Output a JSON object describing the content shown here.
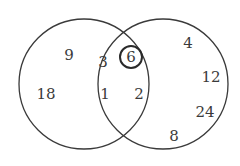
{
  "diagram": {
    "type": "venn",
    "circles": [
      {
        "id": "left",
        "cx": 84,
        "cy": 84,
        "r": 65
      },
      {
        "id": "right",
        "cx": 163,
        "cy": 84,
        "r": 65
      }
    ],
    "highlight": {
      "cx": 131,
      "cy": 56,
      "r": 11,
      "value": "6"
    },
    "numbers": {
      "left_only": [
        {
          "value": "9",
          "x": 69,
          "y": 59
        },
        {
          "value": "18",
          "x": 45,
          "y": 98
        }
      ],
      "intersection": [
        {
          "value": "3",
          "x": 103,
          "y": 65
        },
        {
          "value": "6",
          "x": 131,
          "y": 61
        },
        {
          "value": "1",
          "x": 105,
          "y": 97
        },
        {
          "value": "2",
          "x": 139,
          "y": 97
        }
      ],
      "right_only": [
        {
          "value": "4",
          "x": 188,
          "y": 47
        },
        {
          "value": "12",
          "x": 211,
          "y": 81
        },
        {
          "value": "24",
          "x": 205,
          "y": 116
        },
        {
          "value": "8",
          "x": 174,
          "y": 140
        }
      ]
    },
    "colors": {
      "stroke": "#3a3a3a",
      "text": "#3a3a3a",
      "background": "#ffffff"
    }
  }
}
